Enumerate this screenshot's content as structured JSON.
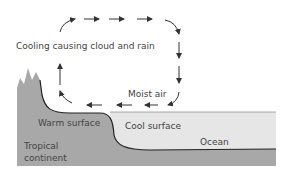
{
  "diagram": {
    "labels": {
      "cooling": "Cooling causing cloud and rain",
      "moist_air": "Moist air",
      "warm_surface": "Warm surface",
      "cool_surface": "Cool surface",
      "ocean": "Ocean",
      "tropical": "Tropical",
      "continent": "continent"
    },
    "colors": {
      "land": "#a8a8a8",
      "ocean": "#e6e6e6",
      "seabed": "#a8a8a8",
      "arrow": "#333333"
    }
  }
}
